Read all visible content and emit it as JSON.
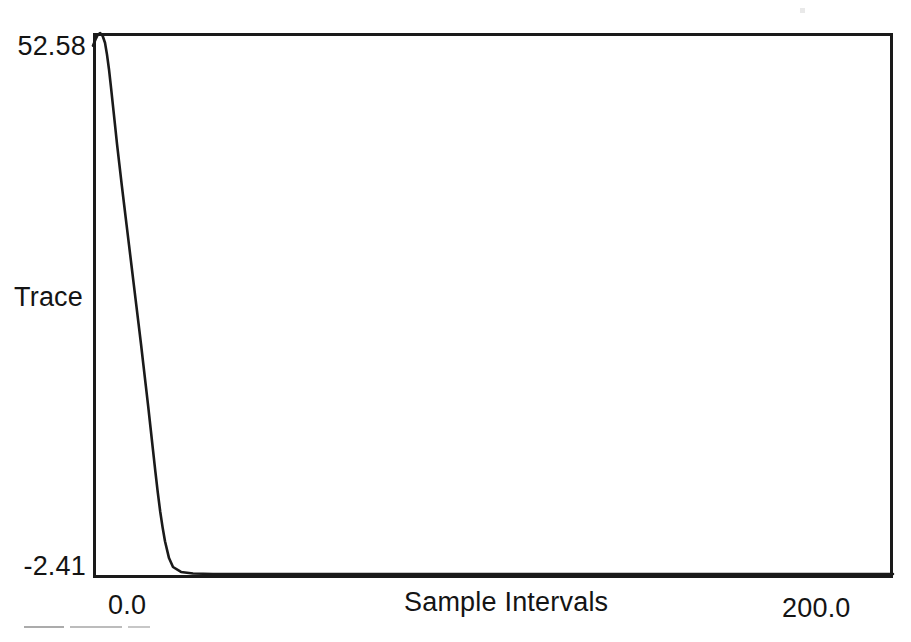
{
  "figure": {
    "background_color": "#ffffff",
    "ink_color": "#1a1a1a"
  },
  "axes": {
    "y_max_label": "52.58",
    "y_min_label": "-2.41",
    "y_title": "Trace",
    "x_min_label": "0.0",
    "x_max_label": "200.0",
    "x_title": "Sample Intervals"
  },
  "chart_data": {
    "type": "line",
    "title": "",
    "subtitle": "",
    "xlabel": "Sample Intervals",
    "ylabel": "Trace",
    "xlim": [
      0.0,
      200.0
    ],
    "ylim": [
      -2.41,
      52.58
    ],
    "grid": false,
    "legend": null,
    "legend_position": "none",
    "xticks": [
      0.0,
      200.0
    ],
    "xticklabels": [
      "0.0",
      "200.0"
    ],
    "yticks": [
      -2.41,
      52.58
    ],
    "yticklabels": [
      "-2.41",
      "52.58"
    ],
    "annotations": [],
    "series": [
      {
        "name": "Trace",
        "color": "#1a1a1a",
        "line_width": 2,
        "x": [
          0.0,
          0.6,
          1.2,
          1.8,
          2.4,
          3.0,
          3.5,
          4.0,
          4.5,
          5.0,
          5.5,
          6.0,
          6.6,
          7.2,
          7.8,
          8.4,
          9.0,
          9.6,
          10.2,
          10.8,
          11.4,
          12.0,
          12.6,
          13.2,
          13.8,
          14.4,
          15.0,
          15.6,
          16.2,
          16.8,
          17.4,
          18.0,
          19.0,
          20.0,
          22.0,
          25.0,
          30.0,
          40.0,
          55.0,
          75.0,
          100.0,
          130.0,
          160.0,
          180.0,
          200.0
        ],
        "y": [
          51.3,
          51.9,
          52.4,
          52.58,
          52.3,
          51.6,
          50.4,
          48.9,
          47.1,
          45.2,
          43.3,
          41.4,
          39.3,
          37.2,
          35.2,
          33.2,
          31.2,
          29.2,
          27.2,
          25.2,
          23.2,
          21.2,
          19.1,
          17.0,
          14.9,
          12.7,
          10.5,
          8.3,
          6.2,
          4.3,
          2.7,
          1.3,
          -0.4,
          -1.3,
          -1.8,
          -1.95,
          -2.0,
          -2.0,
          -2.0,
          -2.0,
          -2.0,
          -2.0,
          -2.0,
          -2.0,
          -2.0
        ]
      }
    ]
  }
}
